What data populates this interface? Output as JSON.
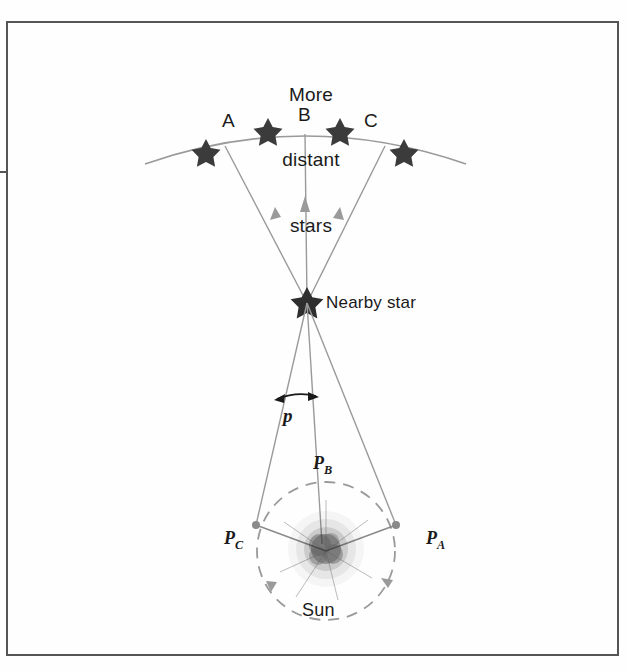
{
  "figure": {
    "title_lines": [
      "More",
      "distant",
      "stars"
    ],
    "nearby_star_label": "Nearby star",
    "sun_label": "Sun",
    "parallax_label": "p",
    "background_star_labels": [
      "A",
      "B",
      "C"
    ],
    "orbit_position_labels": [
      {
        "letter": "P",
        "sub": "C"
      },
      {
        "letter": "P",
        "sub": "B"
      },
      {
        "letter": "P",
        "sub": "A"
      }
    ],
    "colors": {
      "ink": "#1a1a1a",
      "line": "#8a8a8a",
      "star_fill": "#3b3b3b",
      "frame": "#555555",
      "background": "#fefefe"
    }
  }
}
